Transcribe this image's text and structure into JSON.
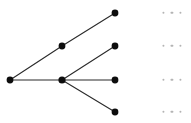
{
  "figure": {
    "type": "tree-diagram",
    "background_color": "#ffffff",
    "node_color": "#0d0d0d",
    "edge_color": "#2b2b2b",
    "ellipsis_color": "#b4b4b4",
    "node_radius": 3.4,
    "width": 191,
    "height": 123
  },
  "nodes": [
    {
      "id": "root",
      "label": "root-node",
      "x": 10,
      "y": 80,
      "r": 3.4
    },
    {
      "id": "upper",
      "label": "upper-branch-node",
      "x": 62,
      "y": 46,
      "r": 3.4
    },
    {
      "id": "hub",
      "label": "hub-node",
      "x": 62,
      "y": 80,
      "r": 3.6
    },
    {
      "id": "leaf1",
      "label": "leaf-node-1",
      "x": 115,
      "y": 13,
      "r": 3.4
    },
    {
      "id": "leaf2",
      "label": "leaf-node-2",
      "x": 115,
      "y": 46,
      "r": 3.4
    },
    {
      "id": "leaf3",
      "label": "leaf-node-3",
      "x": 115,
      "y": 80,
      "r": 3.4
    },
    {
      "id": "leaf4",
      "label": "leaf-node-4",
      "x": 115,
      "y": 112,
      "r": 3.4
    }
  ],
  "edges": [
    {
      "id": "e-root-hub",
      "label": "edge-root-to-hub",
      "x1": 10,
      "y1": 80,
      "x2": 62,
      "y2": 80
    },
    {
      "id": "e-root-upper",
      "label": "edge-root-to-upper",
      "x1": 10,
      "y1": 80,
      "x2": 62,
      "y2": 46
    },
    {
      "id": "e-upper-leaf1",
      "label": "edge-upper-to-leaf1",
      "x1": 62,
      "y1": 46,
      "x2": 115,
      "y2": 13
    },
    {
      "id": "e-hub-leaf2",
      "label": "edge-hub-to-leaf2",
      "x1": 62,
      "y1": 80,
      "x2": 115,
      "y2": 46
    },
    {
      "id": "e-hub-leaf3",
      "label": "edge-hub-to-leaf3",
      "x1": 62,
      "y1": 80,
      "x2": 115,
      "y2": 80
    },
    {
      "id": "e-hub-leaf4",
      "label": "edge-hub-to-leaf4",
      "x1": 62,
      "y1": 80,
      "x2": 115,
      "y2": 112
    }
  ],
  "ellipses": [
    {
      "id": "ell1",
      "label": "ellipsis-row-1",
      "x": 172,
      "y": 13,
      "dots": 3
    },
    {
      "id": "ell2",
      "label": "ellipsis-row-2",
      "x": 172,
      "y": 46,
      "dots": 3
    },
    {
      "id": "ell3",
      "label": "ellipsis-row-3",
      "x": 172,
      "y": 80,
      "dots": 3
    },
    {
      "id": "ell4",
      "label": "ellipsis-row-4",
      "x": 172,
      "y": 112,
      "dots": 3
    }
  ]
}
